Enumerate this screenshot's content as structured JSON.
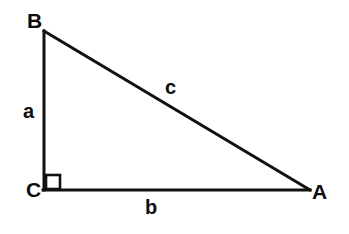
{
  "figure": {
    "name": "right-triangle-abc",
    "background_color": "#ffffff",
    "stroke_color": "#111111",
    "text_color": "#0d0d0d",
    "stroke_width": 3,
    "width": 349,
    "height": 234
  },
  "vertices": [
    {
      "id": "B",
      "label": "B",
      "x": 44,
      "y": 31,
      "label_x": 27,
      "label_y": 10
    },
    {
      "id": "C",
      "label": "C",
      "x": 44,
      "y": 190,
      "label_x": 26,
      "label_y": 179
    },
    {
      "id": "A",
      "label": "A",
      "x": 309,
      "y": 190,
      "label_x": 312,
      "label_y": 181
    }
  ],
  "sides": [
    {
      "id": "a",
      "label": "a",
      "from": "B",
      "to": "C",
      "description": "vertical leg",
      "label_x": 23,
      "label_y": 101
    },
    {
      "id": "b",
      "label": "b",
      "from": "C",
      "to": "A",
      "description": "horizontal leg",
      "label_x": 145,
      "label_y": 197
    },
    {
      "id": "c",
      "label": "c",
      "from": "B",
      "to": "A",
      "description": "hypotenuse",
      "label_x": 165,
      "label_y": 77
    }
  ],
  "right_angle": {
    "at_vertex": "C",
    "marker": "square",
    "x": 46,
    "y": 175,
    "size": 14
  }
}
